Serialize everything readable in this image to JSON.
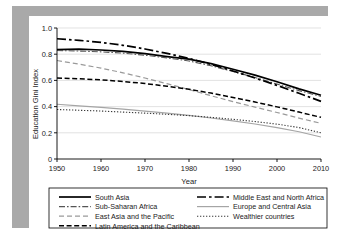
{
  "figure": {
    "background_color": "#a9a9a9",
    "panel_color": "#ffffff",
    "frame_color": "#000000"
  },
  "chart_data": {
    "type": "line",
    "title": "",
    "subtitle": "",
    "xlabel": "Year",
    "ylabel": "Education Gini Index",
    "xlim": [
      1950,
      2010
    ],
    "ylim": [
      0,
      1.0
    ],
    "xticks": [
      1950,
      1960,
      1970,
      1980,
      1990,
      2000,
      2010
    ],
    "xtick_labels": [
      "1950",
      "1960",
      "1970",
      "1980",
      "1990",
      "2000",
      "2010"
    ],
    "yticks": [
      0,
      0.2,
      0.4,
      0.6,
      0.8,
      1.0
    ],
    "ytick_labels": [
      "0",
      "0.2",
      "0.4",
      "0.6",
      "0.8",
      "1.0"
    ],
    "grid": "horizontal",
    "grid_color": "#d5d5d5",
    "legend_position": "below-plot",
    "legend_columns": 2,
    "x": [
      1950,
      1955,
      1960,
      1965,
      1970,
      1975,
      1980,
      1985,
      1990,
      1995,
      2000,
      2005,
      2010
    ],
    "series": [
      {
        "name": "South Asia",
        "color": "#000000",
        "style": "solid",
        "width": 1.7,
        "dasharray": "none",
        "values": [
          0.835,
          0.838,
          0.832,
          0.822,
          0.805,
          0.782,
          0.762,
          0.728,
          0.685,
          0.64,
          0.59,
          0.535,
          0.487
        ]
      },
      {
        "name": "Sub-Saharan Africa",
        "color": "#555555",
        "style": "dash-dot-fine",
        "width": 1.1,
        "dasharray": "6,2,1.6,2",
        "values": [
          0.828,
          0.824,
          0.818,
          0.808,
          0.792,
          0.772,
          0.748,
          0.712,
          0.668,
          0.622,
          0.572,
          0.522,
          0.478
        ]
      },
      {
        "name": "East Asia and the Pacific",
        "color": "#9a9a9a",
        "style": "dashed-light",
        "width": 1.2,
        "dasharray": "5,3",
        "values": [
          0.752,
          0.724,
          0.694,
          0.658,
          0.618,
          0.575,
          0.53,
          0.483,
          0.438,
          0.396,
          0.355,
          0.312,
          0.272
        ]
      },
      {
        "name": "Latin America and the Caribbean",
        "color": "#000000",
        "style": "dashed",
        "width": 1.5,
        "dasharray": "5,2.6",
        "values": [
          0.618,
          0.612,
          0.604,
          0.592,
          0.576,
          0.556,
          0.532,
          0.503,
          0.47,
          0.435,
          0.398,
          0.358,
          0.318
        ]
      },
      {
        "name": "Middle East and North Africa",
        "color": "#000000",
        "style": "dash-dot",
        "width": 1.7,
        "dasharray": "9,3,2.6,3",
        "values": [
          0.918,
          0.906,
          0.89,
          0.868,
          0.84,
          0.806,
          0.768,
          0.722,
          0.672,
          0.618,
          0.562,
          0.502,
          0.44
        ]
      },
      {
        "name": "Europe and Central Asia",
        "color": "#a5a5a5",
        "style": "solid",
        "width": 1.2,
        "dasharray": "none",
        "values": [
          0.418,
          0.406,
          0.394,
          0.381,
          0.366,
          0.35,
          0.333,
          0.313,
          0.291,
          0.267,
          0.24,
          0.208,
          0.168
        ]
      },
      {
        "name": "Wealthier countries",
        "color": "#3a3a3a",
        "style": "dotted",
        "width": 1.1,
        "dasharray": "1.3,1.7",
        "values": [
          0.378,
          0.372,
          0.366,
          0.358,
          0.35,
          0.341,
          0.331,
          0.318,
          0.303,
          0.286,
          0.266,
          0.24,
          0.2
        ]
      }
    ],
    "legend_entries": [
      {
        "label": "South Asia",
        "column": "left",
        "row": 0
      },
      {
        "label": "Sub-Saharan Africa",
        "column": "left",
        "row": 1
      },
      {
        "label": "East Asia and the Pacific",
        "column": "left",
        "row": 2
      },
      {
        "label": "Latin America and the Caribbean",
        "column": "left",
        "row": 3
      },
      {
        "label": "Middle East and North Africa",
        "column": "right",
        "row": 0
      },
      {
        "label": "Europe and Central Asia",
        "column": "right",
        "row": 1
      },
      {
        "label": "Wealthier countries",
        "column": "right",
        "row": 2
      }
    ]
  }
}
